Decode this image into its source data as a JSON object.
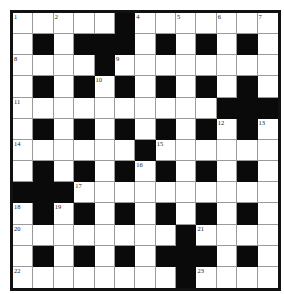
{
  "puzzle": {
    "type": "crossword",
    "rows": 13,
    "cols": 13,
    "colors": {
      "block": "#0a0a0a",
      "cell": "#ffffff",
      "border": "#111111",
      "gridline": "#9a9a9a"
    },
    "grid": [
      ".....#.......",
      ".#.###.#.#.#.",
      "....#........",
      ".#.#.#.#.#.#.",
      "..........###",
      ".#.#.#.#.#.#.",
      "......#......",
      ".#.#.#.#.#.#.",
      "###..........",
      ".#.#.#.#.#.#.",
      "........#....",
      ".#.#.#.###.#.",
      "........#...."
    ],
    "numbers": [
      {
        "n": "1",
        "r": 0,
        "c": 0
      },
      {
        "n": "2",
        "r": 0,
        "c": 2
      },
      {
        "n": "3",
        "r": 0,
        "c": 5
      },
      {
        "n": "4",
        "r": 0,
        "c": 6
      },
      {
        "n": "5",
        "r": 0,
        "c": 8
      },
      {
        "n": "6",
        "r": 0,
        "c": 10
      },
      {
        "n": "7",
        "r": 0,
        "c": 12
      },
      {
        "n": "8",
        "r": 2,
        "c": 0
      },
      {
        "n": "9",
        "r": 2,
        "c": 5
      },
      {
        "n": "10",
        "r": 3,
        "c": 4
      },
      {
        "n": "11",
        "r": 4,
        "c": 0
      },
      {
        "n": "12",
        "r": 5,
        "c": 10
      },
      {
        "n": "13",
        "r": 5,
        "c": 12
      },
      {
        "n": "14",
        "r": 6,
        "c": 0
      },
      {
        "n": "15",
        "r": 6,
        "c": 7
      },
      {
        "n": "16",
        "r": 7,
        "c": 6
      },
      {
        "n": "17",
        "r": 8,
        "c": 3
      },
      {
        "n": "18",
        "r": 9,
        "c": 0
      },
      {
        "n": "19",
        "r": 9,
        "c": 2
      },
      {
        "n": "20",
        "r": 10,
        "c": 0
      },
      {
        "n": "21",
        "r": 10,
        "c": 9
      },
      {
        "n": "22",
        "r": 12,
        "c": 0
      },
      {
        "n": "23",
        "r": 12,
        "c": 9
      }
    ]
  }
}
